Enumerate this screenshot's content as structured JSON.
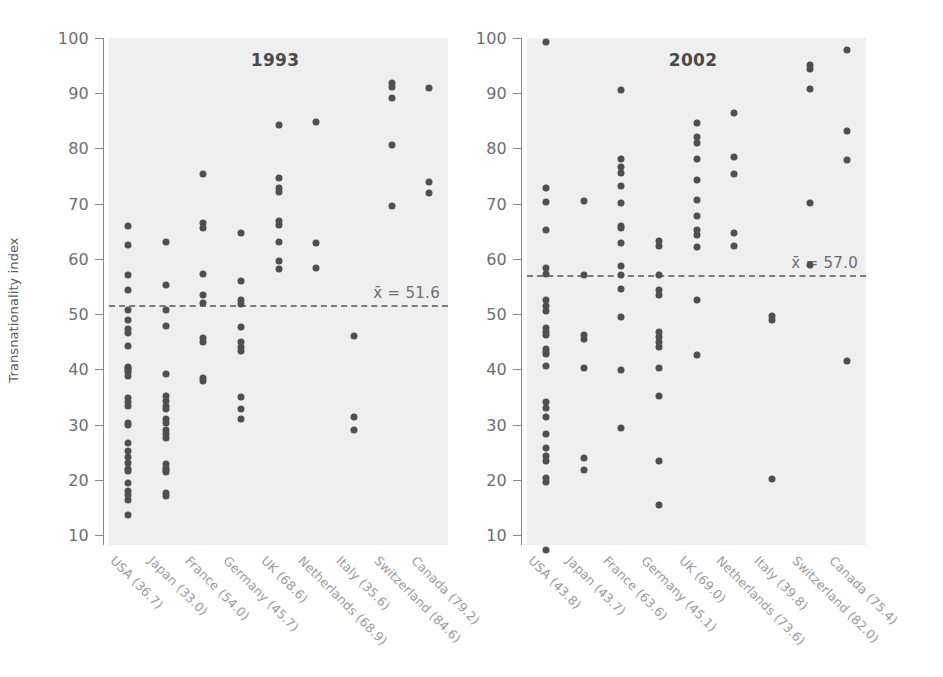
{
  "figure": {
    "ylabel": "Transnationality index",
    "y_ticks": [
      100,
      90,
      80,
      70,
      60,
      50,
      40,
      30,
      20,
      10
    ],
    "ylim": [
      6,
      101
    ],
    "dot_color": "#4f4f51",
    "panel_bg": "#efefef",
    "axis_color": "#8a8a8a"
  },
  "chart_data": {
    "type": "scatter",
    "title": "",
    "xlabel": "",
    "ylabel": "Transnationality index",
    "ylim": [
      6,
      101
    ],
    "grid": false,
    "legend": "none",
    "panels": [
      {
        "title": "1993",
        "mean_label": "x̄ = 51.6",
        "mean_value": 51.6,
        "categories": [
          "USA (36.7)",
          "Japan (33.0)",
          "France (54.0)",
          "Germany (45.7)",
          "UK (68.6)",
          "Netherlands (68.9)",
          "Italy (35.6)",
          "Switzerland (84.6)",
          "Canada (79.2)"
        ],
        "series": [
          {
            "name": "USA (36.7)",
            "values": [
              66.0,
              62.5,
              57.0,
              54.3,
              50.8,
              49.0,
              47.3,
              46.5,
              44.3,
              40.5,
              40.2,
              39.9,
              39.6,
              38.8,
              34.8,
              34.0,
              33.3,
              30.2,
              29.9,
              26.6,
              25.3,
              24.2,
              23.1,
              22.0,
              21.5,
              19.4,
              18.0,
              17.2,
              16.4,
              13.7
            ]
          },
          {
            "name": "Japan (33.0)",
            "values": [
              63.0,
              55.3,
              50.8,
              47.8,
              39.1,
              35.2,
              34.3,
              33.4,
              32.9,
              31.0,
              30.2,
              29.1,
              28.2,
              27.6,
              22.8,
              22.2,
              21.8,
              21.4,
              17.6,
              17.0
            ]
          },
          {
            "name": "France (54.0)",
            "values": [
              75.3,
              66.5,
              65.6,
              57.2,
              53.4,
              52.0,
              45.6,
              45.0,
              38.4,
              37.8
            ]
          },
          {
            "name": "Germany (45.7)",
            "values": [
              64.6,
              56.0,
              52.6,
              51.8,
              47.7,
              44.9,
              44.1,
              43.3,
              35.0,
              32.8,
              31.0
            ]
          },
          {
            "name": "UK (68.6)",
            "values": [
              84.3,
              74.6,
              72.9,
              72.1,
              66.8,
              66.1,
              63.1,
              59.7,
              58.1
            ]
          },
          {
            "name": "Netherlands (68.9)",
            "values": [
              84.7,
              62.8,
              58.3
            ]
          },
          {
            "name": "Italy (35.6)",
            "values": [
              46.0,
              31.4,
              29.1
            ]
          },
          {
            "name": "Switzerland (84.6)",
            "values": [
              91.8,
              91.2,
              89.1,
              80.7,
              69.6
            ]
          },
          {
            "name": "Canada (79.2)",
            "values": [
              91.0,
              73.9,
              72.0
            ]
          }
        ]
      },
      {
        "title": "2002",
        "mean_label": "x̄ = 57.0",
        "mean_value": 57.0,
        "categories": [
          "USA (43.8)",
          "Japan (43.7)",
          "France (63.6)",
          "Germany (45.1)",
          "UK (69.0)",
          "Netherlands (73.6)",
          "Italy (39.8)",
          "Switzerland (82.0)",
          "Canada (75.4)"
        ],
        "series": [
          {
            "name": "USA (43.8)",
            "values": [
              99.2,
              72.8,
              70.3,
              65.2,
              58.4,
              57.3,
              52.6,
              51.4,
              50.6,
              47.4,
              46.8,
              46.2,
              43.6,
              43.2,
              42.8,
              40.6,
              34.1,
              33.0,
              31.4,
              28.2,
              25.7,
              24.3,
              23.4,
              20.3,
              19.6,
              7.3
            ]
          },
          {
            "name": "Japan (43.7)",
            "values": [
              70.4,
              57.0,
              46.3,
              45.5,
              40.3,
              24.0,
              21.7
            ]
          },
          {
            "name": "France (63.6)",
            "values": [
              90.5,
              78.1,
              76.6,
              75.5,
              73.2,
              70.1,
              66.0,
              65.6,
              62.8,
              58.8,
              57.0,
              54.6,
              49.5,
              39.9,
              29.4
            ]
          },
          {
            "name": "Germany (45.1)",
            "values": [
              63.2,
              62.3,
              57.0,
              54.4,
              53.5,
              46.7,
              45.8,
              44.9,
              44.1,
              40.2,
              35.1,
              23.4,
              15.5
            ]
          },
          {
            "name": "UK (69.0)",
            "values": [
              84.6,
              82.0,
              81.0,
              78.1,
              74.2,
              70.6,
              67.7,
              65.2,
              64.3,
              62.1,
              52.6,
              42.6
            ]
          },
          {
            "name": "Netherlands (73.6)",
            "values": [
              86.5,
              78.4,
              75.4,
              64.6,
              62.3
            ]
          },
          {
            "name": "Italy (39.8)",
            "values": [
              49.7,
              48.9,
              20.2
            ]
          },
          {
            "name": "Switzerland (82.0)",
            "values": [
              95.2,
              94.4,
              90.7,
              70.1,
              58.9
            ]
          },
          {
            "name": "Canada (75.4)",
            "values": [
              97.8,
              83.2,
              77.9,
              41.5
            ]
          }
        ]
      }
    ]
  }
}
